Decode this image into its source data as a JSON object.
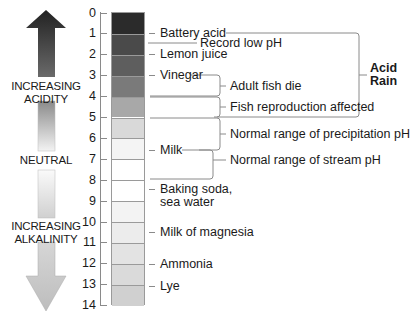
{
  "chart_data": {
    "type": "diagram",
    "axis": {
      "ticks": [
        "0",
        "1",
        "2",
        "3",
        "4",
        "5",
        "6",
        "7",
        "8",
        "9",
        "10",
        "11",
        "12",
        "13",
        "14"
      ],
      "range": [
        0,
        14
      ]
    },
    "side_labels": {
      "top": "INCREASING\nACIDITY",
      "middle": "NEUTRAL",
      "bottom": "INCREASING\nALKALINITY"
    },
    "substances": [
      {
        "label": "Battery acid",
        "ph": 1
      },
      {
        "label": "Lemon juice",
        "ph": 2
      },
      {
        "label": "Vinegar",
        "ph": 3
      },
      {
        "label": "Milk",
        "ph": 6.6
      },
      {
        "label": "Baking soda,\nsea water",
        "ph": 8.5
      },
      {
        "label": "Milk of magnesia",
        "ph": 10.5
      },
      {
        "label": "Ammonia",
        "ph": 12
      },
      {
        "label": "Lye",
        "ph": 13
      }
    ],
    "annotations": [
      {
        "label": "Record low pH",
        "ph": 1.5
      },
      {
        "label": "Adult fish die",
        "range": [
          3,
          4
        ]
      },
      {
        "label": "Fish reproduction affected",
        "range": [
          4,
          5
        ]
      },
      {
        "label": "Normal range of precipitation pH",
        "range": [
          5,
          6.6
        ]
      },
      {
        "label": "Normal range of stream pH",
        "range": [
          6.6,
          8
        ]
      },
      {
        "label": "Acid Rain",
        "range": [
          1,
          5
        ]
      }
    ]
  },
  "labels": {
    "increasing_acidity_1": "INCREASING",
    "increasing_acidity_2": "ACIDITY",
    "neutral": "NEUTRAL",
    "increasing_alkalinity_1": "INCREASING",
    "increasing_alkalinity_2": "ALKALINITY",
    "ticks": [
      "0",
      "1",
      "2",
      "3",
      "4",
      "5",
      "6",
      "7",
      "8",
      "9",
      "10",
      "11",
      "12",
      "13",
      "14"
    ],
    "battery_acid": "Battery acid",
    "record_low": "Record low pH",
    "lemon_juice": "Lemon juice",
    "vinegar": "Vinegar",
    "adult_fish": "Adult fish die",
    "fish_repro": "Fish reproduction affected",
    "precip": "Normal range of precipitation pH",
    "milk": "Milk",
    "stream": "Normal range of stream pH",
    "baking_soda_1": "Baking soda,",
    "baking_soda_2": "sea water",
    "milk_magnesia": "Milk of magnesia",
    "ammonia": "Ammonia",
    "lye": "Lye",
    "acid_rain_1": "Acid",
    "acid_rain_2": "Rain"
  },
  "colors": {
    "segments": [
      "#2b2b2b",
      "#4a4a4a",
      "#5e5e5e",
      "#7a7a7a",
      "#a8a8a8",
      "#d9d9d9",
      "#f4f4f4",
      "#ffffff",
      "#ffffff",
      "#f3f3f3",
      "#ececec",
      "#e3e3e3",
      "#dadada",
      "#d0d0d0"
    ],
    "line": "#8a8a8a"
  }
}
